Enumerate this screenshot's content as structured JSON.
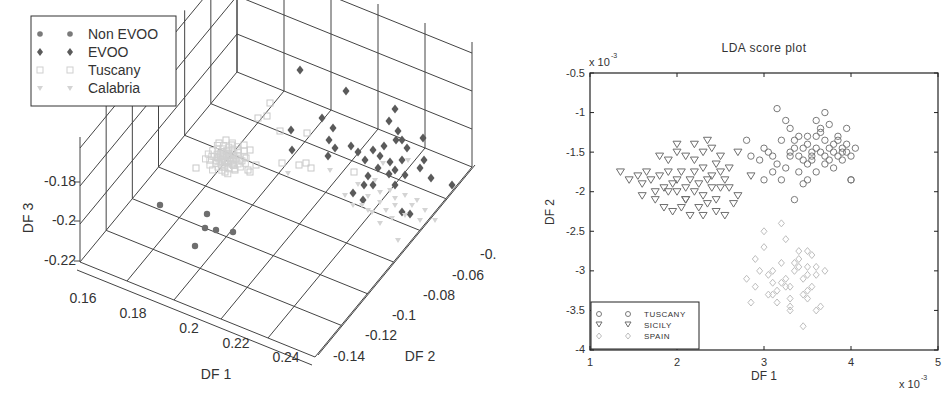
{
  "chart_data": [
    {
      "type": "scatter",
      "subtype": "scatter3d",
      "title": "",
      "xlabel": "DF 1",
      "ylabel": "DF 2",
      "zlabel": "DF 3",
      "x_ticks": [
        "0.16",
        "0.18",
        "0.2",
        "0.22",
        "0.24"
      ],
      "y_ticks": [
        "-0.14",
        "-0.12",
        "-0.1",
        "-0.08",
        "-0.06",
        "-0.0"
      ],
      "z_ticks": [
        "-0.22",
        "-0.2",
        "-0.18"
      ],
      "xlim": [
        0.15,
        0.25
      ],
      "ylim": [
        -0.15,
        -0.04
      ],
      "zlim": [
        -0.23,
        -0.15
      ],
      "grid": true,
      "legend_position": "upper-left",
      "legend": [
        "Non EVOO",
        "EVOO",
        "Tuscany",
        "Calabria"
      ],
      "series": [
        {
          "name": "Non EVOO",
          "marker": "filled-circle",
          "color": "#6e6e6e",
          "points_screen": [
            [
              160,
              205
            ],
            [
              207,
              214
            ],
            [
              205,
              228
            ],
            [
              216,
              230
            ],
            [
              233,
              232
            ],
            [
              195,
              246
            ]
          ]
        },
        {
          "name": "EVOO",
          "marker": "filled-diamond",
          "color": "#5a5a5a",
          "points_screen": [
            [
              300,
              70
            ],
            [
              346,
              91
            ],
            [
              395,
              109
            ],
            [
              322,
              118
            ],
            [
              389,
              121
            ],
            [
              291,
              130
            ],
            [
              333,
              128
            ],
            [
              292,
              150
            ],
            [
              329,
              140
            ],
            [
              335,
              148
            ],
            [
              328,
              156
            ],
            [
              351,
              146
            ],
            [
              358,
              152
            ],
            [
              365,
              160
            ],
            [
              373,
              150
            ],
            [
              380,
              156
            ],
            [
              384,
              146
            ],
            [
              390,
              162
            ],
            [
              395,
              170
            ],
            [
              389,
              174
            ],
            [
              402,
              160
            ],
            [
              407,
              148
            ],
            [
              396,
              140
            ],
            [
              398,
              131
            ],
            [
              402,
              140
            ],
            [
              423,
              138
            ],
            [
              424,
              160
            ],
            [
              431,
              178
            ],
            [
              373,
              185
            ],
            [
              364,
              185
            ],
            [
              395,
              185
            ],
            [
              353,
              193
            ],
            [
              363,
              200
            ],
            [
              452,
              185
            ],
            [
              402,
              212
            ],
            [
              410,
              214
            ],
            [
              368,
              176
            ],
            [
              378,
              168
            ],
            [
              405,
              175
            ],
            [
              420,
              168
            ]
          ]
        },
        {
          "name": "Tuscany",
          "marker": "open-square",
          "color": "#c8c8c8",
          "points_screen": [
            [
              219,
              143
            ],
            [
              226,
              140
            ],
            [
              232,
              145
            ],
            [
              222,
              152
            ],
            [
              230,
              155
            ],
            [
              238,
              150
            ],
            [
              244,
              145
            ],
            [
              240,
              160
            ],
            [
              225,
              162
            ],
            [
              218,
              158
            ],
            [
              246,
              158
            ],
            [
              250,
              150
            ],
            [
              235,
              170
            ],
            [
              225,
              172
            ],
            [
              248,
              170
            ],
            [
              256,
              165
            ],
            [
              270,
              103
            ],
            [
              267,
              116
            ],
            [
              258,
              118
            ],
            [
              280,
              131
            ],
            [
              307,
              133
            ],
            [
              250,
              172
            ],
            [
              282,
              163
            ],
            [
              299,
              165
            ],
            [
              306,
              163
            ],
            [
              196,
              168
            ],
            [
              311,
              168
            ],
            [
              354,
              172
            ]
          ]
        },
        {
          "name": "Calabria",
          "marker": "filled-triangle-down",
          "color": "#d4d4d4",
          "points_screen": [
            [
              358,
              184
            ],
            [
              375,
              180
            ],
            [
              390,
              190
            ],
            [
              368,
              196
            ],
            [
              380,
              202
            ],
            [
              395,
              198
            ],
            [
              405,
              195
            ],
            [
              412,
              205
            ],
            [
              386,
              210
            ],
            [
              372,
              212
            ],
            [
              362,
              205
            ],
            [
              417,
              200
            ],
            [
              405,
              215
            ],
            [
              392,
              218
            ],
            [
              425,
              210
            ],
            [
              395,
              205
            ],
            [
              380,
              192
            ],
            [
              345,
              195
            ],
            [
              435,
              220
            ],
            [
              420,
              220
            ],
            [
              380,
              223
            ],
            [
              368,
              210
            ],
            [
              353,
              205
            ],
            [
              398,
              240
            ],
            [
              288,
              173
            ],
            [
              330,
              170
            ],
            [
              383,
              163
            ],
            [
              408,
              160
            ]
          ]
        }
      ]
    },
    {
      "type": "scatter",
      "title": "LDA score plot",
      "xlabel": "DF 1",
      "ylabel": "DF 2",
      "x_multiplier": "x 10^-3",
      "y_multiplier": "x 10^-3",
      "xlim": [
        1,
        5
      ],
      "ylim": [
        -4,
        -0.5
      ],
      "x_ticks": [
        1,
        2,
        3,
        4,
        5
      ],
      "y_ticks": [
        -4,
        -3.5,
        -3,
        -2.5,
        -2,
        -1.5,
        -1,
        -0.5
      ],
      "grid": false,
      "legend_position": "lower-left",
      "legend": [
        "TUSCANY",
        "SICILY",
        "SPAIN"
      ],
      "series": [
        {
          "name": "TUSCANY",
          "marker": "open-circle",
          "color": "#7a7a7a",
          "x": [
            2.8,
            2.85,
            2.95,
            3.0,
            3.05,
            3.1,
            3.15,
            3.2,
            3.25,
            3.3,
            3.35,
            3.4,
            3.4,
            3.45,
            3.5,
            3.55,
            3.55,
            3.6,
            3.6,
            3.65,
            3.65,
            3.7,
            3.7,
            3.75,
            3.75,
            3.8,
            3.8,
            3.85,
            3.85,
            3.9,
            3.9,
            3.95,
            3.95,
            4.0,
            4.0,
            4.05,
            3.2,
            3.3,
            3.4,
            3.45,
            3.5,
            3.6,
            3.7,
            3.3,
            3.35,
            3.5,
            3.6,
            3.7,
            3.8,
            3.9,
            3.65,
            3.75,
            3.85,
            3.55,
            3.95,
            3.0,
            3.1,
            3.25,
            3.45,
            4.0,
            3.15,
            3.35,
            3.5
          ],
          "y": [
            -1.35,
            -1.55,
            -1.6,
            -1.45,
            -1.5,
            -1.75,
            -1.65,
            -1.35,
            -1.1,
            -1.2,
            -1.35,
            -1.3,
            -1.55,
            -1.45,
            -1.4,
            -1.5,
            -1.6,
            -1.3,
            -1.45,
            -1.5,
            -1.2,
            -1.35,
            -1.55,
            -1.45,
            -1.6,
            -1.4,
            -1.5,
            -1.3,
            -1.55,
            -1.45,
            -1.6,
            -1.2,
            -1.5,
            -1.55,
            -1.85,
            -1.45,
            -1.85,
            -1.55,
            -1.75,
            -1.9,
            -1.65,
            -1.1,
            -1.0,
            -1.5,
            -1.45,
            -1.3,
            -1.75,
            -1.65,
            -1.7,
            -1.5,
            -1.25,
            -1.15,
            -1.35,
            -1.55,
            -1.4,
            -1.85,
            -1.55,
            -1.7,
            -1.6,
            -1.85,
            -0.95,
            -2.1,
            -1.85
          ]
        },
        {
          "name": "SICILY",
          "marker": "open-triangle-down",
          "color": "#6e6e6e",
          "x": [
            1.35,
            1.45,
            1.55,
            1.6,
            1.65,
            1.7,
            1.75,
            1.8,
            1.85,
            1.9,
            1.95,
            2.0,
            2.0,
            2.05,
            2.1,
            2.1,
            2.15,
            2.2,
            2.2,
            2.25,
            2.3,
            2.3,
            2.35,
            2.4,
            2.4,
            2.45,
            2.5,
            2.5,
            2.55,
            2.6,
            2.65,
            2.7,
            1.8,
            1.9,
            2.0,
            2.1,
            2.2,
            2.3,
            2.4,
            2.5,
            1.85,
            1.95,
            2.05,
            2.15,
            2.25,
            2.35,
            2.45,
            2.55,
            2.0,
            2.2,
            1.75,
            2.6,
            2.3,
            2.1,
            1.9,
            2.45,
            2.7,
            2.85,
            1.6,
            2.35
          ],
          "y": [
            -1.75,
            -1.85,
            -1.8,
            -1.9,
            -1.75,
            -1.85,
            -2.0,
            -1.8,
            -1.95,
            -1.75,
            -1.9,
            -2.0,
            -1.85,
            -1.75,
            -1.95,
            -2.1,
            -1.85,
            -1.75,
            -2.0,
            -1.9,
            -1.7,
            -2.05,
            -1.85,
            -1.95,
            -1.8,
            -2.1,
            -1.75,
            -1.95,
            -1.85,
            -1.7,
            -2.15,
            -2.05,
            -1.55,
            -1.6,
            -1.5,
            -1.55,
            -1.6,
            -1.5,
            -1.45,
            -1.55,
            -2.2,
            -2.25,
            -2.2,
            -2.3,
            -2.2,
            -2.15,
            -2.25,
            -2.3,
            -1.4,
            -1.4,
            -2.1,
            -1.95,
            -2.3,
            -2.1,
            -2.0,
            -1.65,
            -1.5,
            -1.8,
            -2.05,
            -1.35
          ]
        },
        {
          "name": "SPAIN",
          "marker": "open-diamond",
          "color": "#bdbdbd",
          "x": [
            2.8,
            2.85,
            2.9,
            2.95,
            3.0,
            3.05,
            3.1,
            3.15,
            3.2,
            3.25,
            3.3,
            3.3,
            3.35,
            3.4,
            3.45,
            3.5,
            3.5,
            3.55,
            3.6,
            3.65,
            3.0,
            3.1,
            3.2,
            3.3,
            3.4,
            3.5,
            3.6,
            3.15,
            3.25,
            3.35,
            3.45,
            3.55,
            2.9,
            3.05,
            3.25,
            3.4,
            3.5,
            3.6,
            3.7,
            3.45,
            3.5,
            3.3,
            3.2,
            3.1
          ],
          "y": [
            -3.1,
            -3.4,
            -3.2,
            -3.0,
            -2.7,
            -3.3,
            -3.0,
            -3.25,
            -2.9,
            -3.1,
            -3.2,
            -3.5,
            -3.0,
            -2.85,
            -3.1,
            -3.35,
            -2.95,
            -3.2,
            -3.05,
            -3.45,
            -2.5,
            -3.15,
            -2.4,
            -3.35,
            -2.75,
            -3.05,
            -3.5,
            -3.4,
            -3.2,
            -2.9,
            -3.3,
            -2.8,
            -2.85,
            -3.05,
            -2.6,
            -2.95,
            -3.25,
            -2.95,
            -3.0,
            -3.7,
            -2.75,
            -3.45,
            -3.15,
            -3.3
          ]
        }
      ]
    }
  ],
  "left_chart": {
    "zlabel": "DF 3",
    "xlabel": "DF 1",
    "ylabel": "DF 2",
    "legend": [
      {
        "label": "Non EVOO"
      },
      {
        "label": "EVOO"
      },
      {
        "label": "Tuscany"
      },
      {
        "label": "Calabria"
      }
    ],
    "z_ticks": [
      "-0.18",
      "-0.2",
      "-0.22"
    ],
    "x_ticks": [
      "0.16",
      "0.18",
      "0.2",
      "0.22",
      "0.24"
    ],
    "y_ticks": [
      "-0.14",
      "-0.12",
      "-0.1",
      "-0.08",
      "-0.06",
      "-0."
    ]
  },
  "right_chart": {
    "title": "LDA score plot",
    "xlabel": "DF 1",
    "ylabel": "DF 2",
    "y_multiplier_base": "x 10",
    "y_multiplier_exp": "-3",
    "x_multiplier_base": "x 10",
    "x_multiplier_exp": "-3",
    "x_ticks": [
      "1",
      "2",
      "3",
      "4",
      "5"
    ],
    "y_ticks": [
      "-0.5",
      "-1",
      "-1.5",
      "-2",
      "-2.5",
      "-3",
      "-3.5",
      "-4"
    ],
    "legend": [
      {
        "label": "TUSCANY"
      },
      {
        "label": "SICILY"
      },
      {
        "label": "SPAIN"
      }
    ]
  }
}
